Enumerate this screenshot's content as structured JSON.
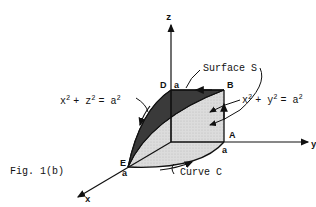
{
  "figure": {
    "caption": "Fig. 1(b)",
    "axes": {
      "x": "x",
      "y": "y",
      "z": "z"
    },
    "points": {
      "D": "D",
      "B": "B",
      "A": "A",
      "E": "E"
    },
    "intercepts": {
      "z_top": "a",
      "y_side": "a",
      "x_front": "a"
    },
    "labels": {
      "surface": "Surface S",
      "curve": "Curve C",
      "cyl_xz_base": "x",
      "cyl_xz_plus": "+ z",
      "cyl_xz_eq": "= a",
      "cyl_xy_base": "x",
      "cyl_xy_plus": "+ y",
      "cyl_xy_eq": "= a",
      "exponent": "2"
    },
    "colors": {
      "dark_face": "#3a3a3a",
      "light_face": "#d8d8d8",
      "ink": "#111111"
    }
  }
}
